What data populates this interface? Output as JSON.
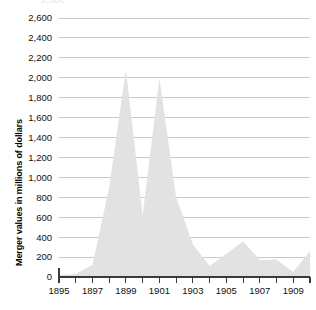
{
  "chart_data": {
    "type": "area",
    "title": "",
    "xlabel": "",
    "ylabel": "Merger values in millions of dollars",
    "xlim": [
      1895,
      1910
    ],
    "ylim": [
      0,
      2600
    ],
    "y_tick_step": 200,
    "grid": true,
    "legend": false,
    "series_color": "#e2e2e2",
    "x": [
      1895,
      1896,
      1897,
      1898,
      1899,
      1900,
      1901,
      1902,
      1903,
      1904,
      1905,
      1906,
      1907,
      1908,
      1909,
      1910
    ],
    "values": [
      20,
      30,
      120,
      900,
      2080,
      620,
      1990,
      800,
      330,
      110,
      230,
      360,
      170,
      175,
      50,
      260
    ],
    "series": [
      {
        "name": "Merger values",
        "values": [
          20,
          30,
          120,
          900,
          2080,
          620,
          1990,
          800,
          330,
          110,
          230,
          360,
          170,
          175,
          50,
          260
        ]
      }
    ],
    "categories": [
      "1895",
      "1896",
      "1897",
      "1898",
      "1899",
      "1900",
      "1901",
      "1902",
      "1903",
      "1904",
      "1905",
      "1906",
      "1907",
      "1908",
      "1909",
      "1910"
    ],
    "y_tick_labels": [
      "0",
      "200",
      "400",
      "600",
      "800",
      "1,000",
      "1,200",
      "1,400",
      "1,600",
      "1,800",
      "2,000",
      "2,200",
      "2,400",
      "2,600"
    ],
    "y_tick_values": [
      0,
      200,
      400,
      600,
      800,
      1000,
      1200,
      1400,
      1600,
      1800,
      2000,
      2200,
      2400,
      2600
    ],
    "x_tick_labels_shown": [
      "1895",
      "1897",
      "1899",
      "1901",
      "1903",
      "1905",
      "1907",
      "1909"
    ],
    "x_tick_values_all": [
      1895,
      1896,
      1897,
      1898,
      1899,
      1900,
      1901,
      1902,
      1903,
      1904,
      1905,
      1906,
      1907,
      1908,
      1909,
      1910
    ],
    "clipped_top_label": "2,800"
  }
}
